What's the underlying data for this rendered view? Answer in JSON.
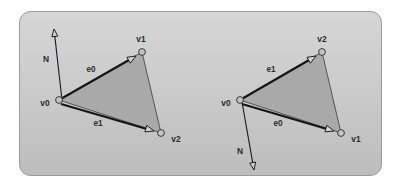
{
  "figure": {
    "canvas": {
      "width": 402,
      "height": 190,
      "background": "#ffffff"
    },
    "panel": {
      "x": 19,
      "y": 11,
      "width": 363,
      "height": 165,
      "corner_radius": 11,
      "fill_top": "#d2d2d2",
      "fill_bottom": "#c2c2c2",
      "border_color": "#9a9a9a"
    },
    "style": {
      "triangle_fill": "#a9a9a9",
      "triangle_stroke": "#4a4a4a",
      "vector_color": "#151515",
      "arrowhead_fill": "#d2d2d2",
      "vertex_fill": "#c3c3c3",
      "vertex_stroke": "#3a3a3a",
      "label_color": "#2b2b2b"
    },
    "diagrams": [
      {
        "id": "left",
        "name": "counter-clockwise-winding",
        "winding": "counter-clockwise",
        "normal_direction": "up",
        "vertices": [
          {
            "id": "v0",
            "label": "v0",
            "x": 59,
            "y": 100,
            "label_x": 45,
            "label_y": 104,
            "label_anchor": "middle"
          },
          {
            "id": "v1",
            "label": "v1",
            "x": 142,
            "y": 52,
            "label_x": 141,
            "label_y": 40,
            "label_anchor": "middle"
          },
          {
            "id": "v2",
            "label": "v2",
            "x": 161,
            "y": 133,
            "label_x": 176,
            "label_y": 140,
            "label_anchor": "middle"
          }
        ],
        "edges": [
          {
            "id": "e0",
            "label": "e0",
            "from": "v0",
            "to": "v1",
            "x1": 59,
            "y1": 100,
            "x2": 136,
            "y2": 56,
            "label_x": 91,
            "label_y": 70
          },
          {
            "id": "e1",
            "label": "e1",
            "from": "v0",
            "to": "v2",
            "x1": 61,
            "y1": 104,
            "x2": 154,
            "y2": 131,
            "label_x": 98,
            "label_y": 124
          }
        ],
        "normal": {
          "id": "N",
          "label": "N",
          "x1": 62,
          "y1": 100,
          "x2": 54,
          "y2": 29,
          "label_x": 46,
          "label_y": 60
        }
      },
      {
        "id": "right",
        "name": "clockwise-winding",
        "winding": "clockwise",
        "normal_direction": "down",
        "vertices": [
          {
            "id": "v0",
            "label": "v0",
            "x": 240,
            "y": 100,
            "label_x": 226,
            "label_y": 104,
            "label_anchor": "middle"
          },
          {
            "id": "v2",
            "label": "v2",
            "x": 322,
            "y": 52,
            "label_x": 322,
            "label_y": 40,
            "label_anchor": "middle"
          },
          {
            "id": "v1",
            "label": "v1",
            "x": 341,
            "y": 133,
            "label_x": 356,
            "label_y": 140,
            "label_anchor": "middle"
          }
        ],
        "edges": [
          {
            "id": "e1",
            "label": "e1",
            "from": "v0",
            "to": "v2",
            "x1": 240,
            "y1": 100,
            "x2": 316,
            "y2": 56,
            "label_x": 271,
            "label_y": 70
          },
          {
            "id": "e0",
            "label": "e0",
            "from": "v0",
            "to": "v1",
            "x1": 242,
            "y1": 104,
            "x2": 334,
            "y2": 131,
            "label_x": 278,
            "label_y": 124
          }
        ],
        "normal": {
          "id": "N",
          "label": "N",
          "x1": 242,
          "y1": 102,
          "x2": 254,
          "y2": 170,
          "label_x": 240,
          "label_y": 152
        }
      }
    ]
  }
}
